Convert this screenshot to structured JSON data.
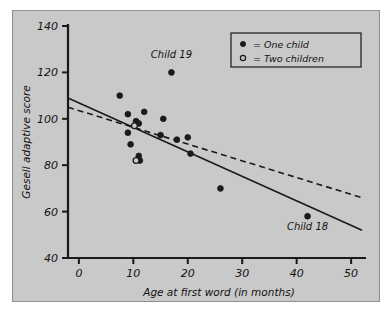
{
  "figure": {
    "background_color": "#c9c9c9",
    "page_color": "#ffffff",
    "frame_color": "#8e8e8e",
    "axis_color": "#1a1a1a",
    "point_color": "#1a1a1a",
    "line_color": "#1a1a1a"
  },
  "legend": {
    "position": "top-right",
    "entries": [
      {
        "marker": "filled-circle",
        "label": "= One child"
      },
      {
        "marker": "open-circle",
        "label": "= Two children"
      }
    ]
  },
  "annotations": [
    {
      "name": "child-19-label",
      "text": "Child 19",
      "x": 17,
      "y": 126
    },
    {
      "name": "child-18-label",
      "text": "Child 18",
      "x": 42,
      "y": 52
    }
  ],
  "chart_data": {
    "type": "scatter",
    "title": "",
    "xlabel": "Age at first word (in months)",
    "ylabel": "Gesell adaptive score",
    "xlim": [
      -2,
      52
    ],
    "ylim": [
      40,
      140
    ],
    "xticks": [
      0,
      10,
      20,
      30,
      40,
      50
    ],
    "yticks": [
      40,
      60,
      80,
      100,
      120,
      140
    ],
    "xtick_labels": [
      "0",
      "10",
      "20",
      "30",
      "40",
      "50"
    ],
    "ytick_labels": [
      "40",
      "60",
      "80",
      "100",
      "120",
      "140"
    ],
    "grid": false,
    "series": [
      {
        "name": "One child",
        "marker": "filled-circle",
        "points": [
          {
            "x": 7.5,
            "y": 110
          },
          {
            "x": 9.0,
            "y": 102
          },
          {
            "x": 9.0,
            "y": 94
          },
          {
            "x": 9.5,
            "y": 89
          },
          {
            "x": 10.5,
            "y": 99
          },
          {
            "x": 11.0,
            "y": 98
          },
          {
            "x": 11.0,
            "y": 84
          },
          {
            "x": 11.2,
            "y": 82
          },
          {
            "x": 12.0,
            "y": 103
          },
          {
            "x": 15.0,
            "y": 93
          },
          {
            "x": 15.5,
            "y": 100
          },
          {
            "x": 17.0,
            "y": 120
          },
          {
            "x": 18.0,
            "y": 91
          },
          {
            "x": 20.0,
            "y": 92
          },
          {
            "x": 20.5,
            "y": 85
          },
          {
            "x": 26.0,
            "y": 70
          },
          {
            "x": 42.0,
            "y": 58
          }
        ]
      },
      {
        "name": "Two children",
        "marker": "open-circle",
        "points": [
          {
            "x": 10.2,
            "y": 97
          },
          {
            "x": 10.5,
            "y": 82
          }
        ]
      }
    ],
    "lines": [
      {
        "name": "regression-all-data",
        "style": "solid",
        "x0": -2,
        "y0": 109,
        "x1": 52,
        "y1": 52
      },
      {
        "name": "regression-excluding-outliers",
        "style": "dashed",
        "x0": -2,
        "y0": 105,
        "x1": 52,
        "y1": 66
      }
    ]
  }
}
